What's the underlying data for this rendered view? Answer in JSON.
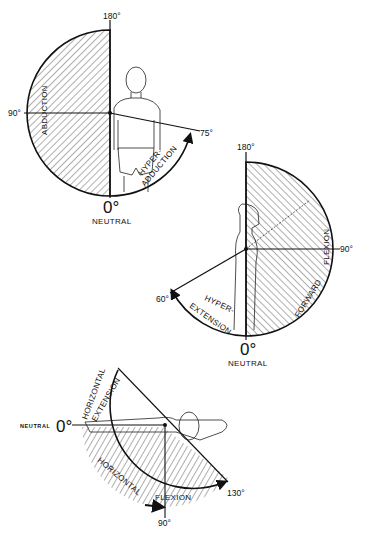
{
  "figure": {
    "diagrams": [
      {
        "id": "abduction",
        "labels": {
          "top": "180°",
          "left": "90°",
          "right": "75°",
          "bottom": "0°",
          "neutral": "NEUTRAL",
          "arc_main": "ABDUCTION",
          "arc_hyper_1": "HYPER-",
          "arc_hyper_2": "ADDUCTION"
        }
      },
      {
        "id": "flexion",
        "labels": {
          "top": "180°",
          "right": "90°",
          "left": "60°",
          "bottom": "0°",
          "neutral": "NEUTRAL",
          "arc_main_1": "FORWARD",
          "arc_main_2": "FLEXION",
          "arc_hyper_1": "HYPER-",
          "arc_hyper_2": "EXTENSION"
        }
      },
      {
        "id": "horizontal",
        "labels": {
          "left": "0°",
          "neutral": "NEUTRAL",
          "bottom": "90°",
          "right": "130°",
          "arc_ext_1": "HORIZONTAL",
          "arc_ext_2": "EXTENSION",
          "arc_flex_1": "HORIZONTAL",
          "arc_flex_2": "FLEXION"
        }
      }
    ]
  }
}
